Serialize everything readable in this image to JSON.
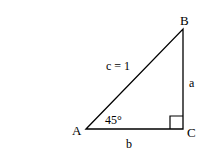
{
  "diagram": {
    "type": "right-triangle",
    "vertices": {
      "A": {
        "label": "A"
      },
      "B": {
        "label": "B"
      },
      "C": {
        "label": "C"
      }
    },
    "sides": {
      "hypotenuse": "c = 1",
      "vertical": "a",
      "horizontal": "b"
    },
    "angle_A": "45°",
    "right_angle_at": "C",
    "colors": {
      "line": "#000000",
      "background": "#ffffff"
    }
  }
}
